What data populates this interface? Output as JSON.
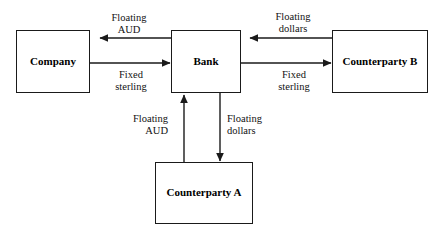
{
  "diagram": {
    "nodes": [
      {
        "id": "company",
        "label": "Company"
      },
      {
        "id": "bank",
        "label": "Bank"
      },
      {
        "id": "counterparty_b",
        "label": "Counterparty\nB"
      },
      {
        "id": "counterparty_a",
        "label": "Counterparty\nA"
      }
    ],
    "flows": [
      {
        "id": "bank_to_company",
        "label": "Floating\nAUD",
        "from": "bank",
        "to": "company",
        "direction": "left"
      },
      {
        "id": "company_to_bank",
        "label": "Fixed\nsterling",
        "from": "company",
        "to": "bank",
        "direction": "right"
      },
      {
        "id": "cpb_to_bank",
        "label": "Floating\ndollars",
        "from": "counterparty_b",
        "to": "bank",
        "direction": "left"
      },
      {
        "id": "bank_to_cpb",
        "label": "Fixed\nsterling",
        "from": "bank",
        "to": "counterparty_b",
        "direction": "right"
      },
      {
        "id": "cpa_to_bank",
        "label": "Floating\nAUD",
        "from": "counterparty_a",
        "to": "bank",
        "direction": "up"
      },
      {
        "id": "bank_to_cpa",
        "label": "Floating\ndollars",
        "from": "bank",
        "to": "counterparty_a",
        "direction": "down"
      }
    ],
    "colors": {
      "stroke": "#1a1a1a",
      "text": "#000000",
      "background": "#ffffff"
    }
  }
}
